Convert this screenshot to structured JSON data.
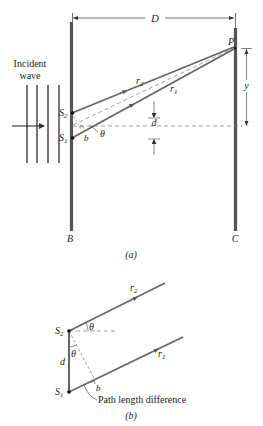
{
  "figure_a": {
    "incident_label_line1": "Incident",
    "incident_label_line2": "wave",
    "distance_label": "D",
    "point_label": "P",
    "slit2_label": "S",
    "slit2_sub": "2",
    "slit1_label": "S",
    "slit1_sub": "1",
    "ray2_label": "r",
    "ray2_sub": "2",
    "ray1_label": "r",
    "ray1_sub": "1",
    "path_diff_label": "b",
    "angle_label": "θ",
    "separation_label": "d",
    "height_label": "y",
    "barrier_label": "B",
    "screen_label": "C",
    "caption": "(a)"
  },
  "figure_b": {
    "slit2_label": "S",
    "slit2_sub": "2",
    "slit1_label": "S",
    "slit1_sub": "1",
    "ray2_label": "r",
    "ray2_sub": "2",
    "ray1_label": "r",
    "ray1_sub": "1",
    "angle_top_label": "θ",
    "angle_inner_label": "θ",
    "separation_label": "d",
    "path_diff_label": "b",
    "annotation": "Path length difference",
    "caption": "(b)"
  },
  "colors": {
    "barrier": "#555555",
    "ray": "#666666",
    "line": "#333333",
    "dashed": "#777777"
  }
}
